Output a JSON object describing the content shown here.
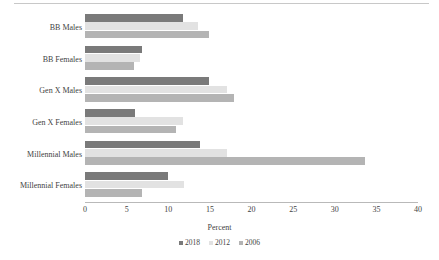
{
  "chart_data": {
    "type": "bar",
    "orientation": "horizontal",
    "title": "",
    "xlabel": "Percent",
    "ylabel": "",
    "xlim": [
      0,
      40
    ],
    "xticks": [
      "0",
      "5",
      "10",
      "15",
      "20",
      "25",
      "30",
      "35",
      "40"
    ],
    "grid": false,
    "legend_position": "bottom",
    "categories": [
      "BB Males",
      "BB Females",
      "Gen X Males",
      "Gen X Females",
      "Millennial Males",
      "Millennial Females"
    ],
    "series": [
      {
        "name": "2018",
        "color": "#7a7a7a",
        "values": [
          11.8,
          6.9,
          14.9,
          6.0,
          13.8,
          10.0
        ]
      },
      {
        "name": "2012",
        "color": "#e2e2e2",
        "values": [
          13.6,
          6.6,
          17.0,
          11.8,
          17.0,
          11.9
        ]
      },
      {
        "name": "2006",
        "color": "#b4b4b4",
        "values": [
          14.9,
          5.9,
          17.9,
          10.9,
          33.6,
          6.9
        ]
      }
    ]
  },
  "colors": {
    "axis": "#b9b9b9",
    "text": "#3f3f3f",
    "background": "#ffffff",
    "series_2018": "#7a7a7a",
    "series_2012": "#e2e2e2",
    "series_2006": "#b4b4b4"
  }
}
